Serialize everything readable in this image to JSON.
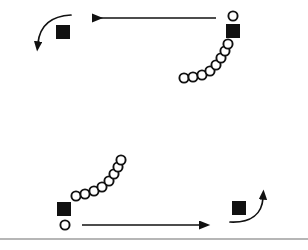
{
  "figure": {
    "width": 308,
    "height": 250,
    "background_color": "#ffffff",
    "stroke_color": "#111111",
    "baseline_color": "#6f6f6f",
    "marker_square_label": "filled-square-marker",
    "marker_circle_label": "open-circle-marker"
  },
  "elements": {
    "top_left_square": {
      "name": "top-left-square-marker",
      "x": 56,
      "y": 25,
      "size": 14
    },
    "top_right_square": {
      "name": "top-right-square-marker",
      "x": 226,
      "y": 24,
      "size": 14
    },
    "bottom_left_square": {
      "name": "bottom-left-square-marker",
      "x": 57,
      "y": 202,
      "size": 14
    },
    "bottom_right_square": {
      "name": "bottom-right-square-marker",
      "x": 232,
      "y": 201,
      "size": 14
    },
    "top_right_lone_circle": {
      "name": "top-right-lone-circle",
      "cx": 233,
      "cy": 16,
      "r": 4.6
    },
    "bottom_left_lone_circle": {
      "name": "bottom-left-lone-circle",
      "cx": 65,
      "cy": 225,
      "r": 4.6
    },
    "top_arrow": {
      "name": "top-leftward-arrow",
      "direction": "left",
      "x_start": 216,
      "x_end": 92,
      "y": 18
    },
    "bottom_arrow": {
      "name": "bottom-rightward-arrow",
      "direction": "right",
      "x_start": 82,
      "x_end": 199,
      "y": 225
    },
    "top_left_curved_arrow": {
      "name": "top-left-curved-arrow",
      "direction": "down-left",
      "path": "M 71,15 C 52,16 40,25 38,43"
    },
    "bottom_right_curved_arrow": {
      "name": "bottom-right-curved-arrow",
      "direction": "up-right",
      "path": "M 230,222 C 251,223 262,214 263,198"
    },
    "upper_circle_chain": {
      "name": "upper-circle-trajectory",
      "radius": 4.6,
      "points": [
        {
          "cx": 184,
          "cy": 78
        },
        {
          "cx": 193,
          "cy": 77
        },
        {
          "cx": 202,
          "cy": 75
        },
        {
          "cx": 210,
          "cy": 71
        },
        {
          "cx": 216,
          "cy": 65
        },
        {
          "cx": 221,
          "cy": 58
        },
        {
          "cx": 225,
          "cy": 51
        },
        {
          "cx": 228,
          "cy": 44
        }
      ]
    },
    "lower_circle_chain": {
      "name": "lower-circle-trajectory",
      "radius": 4.6,
      "points": [
        {
          "cx": 76,
          "cy": 196
        },
        {
          "cx": 85,
          "cy": 194
        },
        {
          "cx": 94,
          "cy": 191
        },
        {
          "cx": 102,
          "cy": 187
        },
        {
          "cx": 109,
          "cy": 181
        },
        {
          "cx": 114,
          "cy": 174
        },
        {
          "cx": 118,
          "cy": 167
        },
        {
          "cx": 121,
          "cy": 160
        }
      ]
    },
    "baseline": {
      "name": "ground-baseline-rule",
      "x_start": 0,
      "x_end": 308,
      "y": 239
    }
  }
}
